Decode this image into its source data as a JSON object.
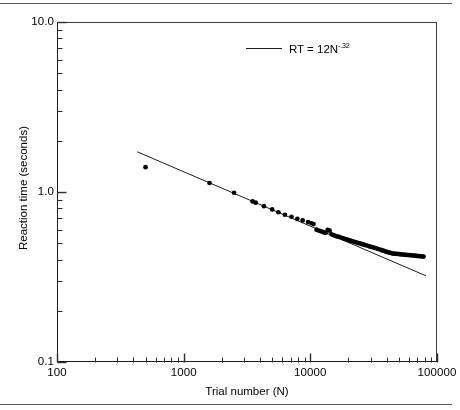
{
  "figure": {
    "name": "power-law-of-practice-plot",
    "background": "#ffffff",
    "ink_color": "#1a1a1a"
  },
  "axes": {
    "x": {
      "title": "Trial number (N)",
      "scale": "log",
      "min": 100,
      "max": 100000,
      "tick_labels": [
        "100",
        "1000",
        "10000",
        "100000"
      ],
      "tick_values": [
        100,
        1000,
        10000,
        100000
      ],
      "minor_ticks": true
    },
    "y": {
      "title": "Reaction time (seconds)",
      "scale": "log",
      "min": 0.1,
      "max": 10.0,
      "tick_labels": [
        "10.0",
        "1.0",
        "0.1"
      ],
      "tick_values": [
        10.0,
        1.0,
        0.1
      ],
      "minor_ticks": true
    }
  },
  "legend": {
    "position": "top-right",
    "swatch": "line-swatch",
    "label_prefix": "RT = 12N",
    "label_exponent": "-.32",
    "label_full": "RT = 12N-.32"
  },
  "chart_data": {
    "type": "scatter",
    "title": "",
    "subtitle": "",
    "xlabel": "Trial number (N)",
    "ylabel": "Reaction time (seconds)",
    "xscale": "log",
    "yscale": "log",
    "xlim": [
      100,
      100000
    ],
    "ylim": [
      0.1,
      10.0
    ],
    "grid": false,
    "legend_position": "top-right",
    "annotations": [],
    "series": [
      {
        "name": "Observed reaction time",
        "type": "scatter",
        "marker": "filled-circle",
        "marker_size_px": 3.6,
        "color": "#000000",
        "points": [
          [
            500,
            1.4
          ],
          [
            1600,
            1.13
          ],
          [
            2500,
            0.99
          ],
          [
            3500,
            0.88
          ],
          [
            3700,
            0.865
          ],
          [
            4300,
            0.825
          ],
          [
            5000,
            0.79
          ],
          [
            5600,
            0.76
          ],
          [
            6300,
            0.735
          ],
          [
            7100,
            0.715
          ],
          [
            7900,
            0.695
          ],
          [
            8700,
            0.68
          ],
          [
            9600,
            0.665
          ],
          [
            10200,
            0.655
          ],
          [
            10600,
            0.648
          ],
          [
            11200,
            0.6
          ],
          [
            11700,
            0.592
          ],
          [
            12200,
            0.586
          ],
          [
            12700,
            0.58
          ],
          [
            13200,
            0.574
          ],
          [
            13700,
            0.598
          ],
          [
            14200,
            0.592
          ],
          [
            14700,
            0.564
          ],
          [
            15200,
            0.558
          ],
          [
            15700,
            0.553
          ],
          [
            16200,
            0.548
          ],
          [
            16800,
            0.545
          ],
          [
            17400,
            0.54
          ],
          [
            18000,
            0.536
          ],
          [
            18600,
            0.531
          ],
          [
            19200,
            0.527
          ],
          [
            19800,
            0.523
          ],
          [
            20500,
            0.519
          ],
          [
            21200,
            0.515
          ],
          [
            21900,
            0.511
          ],
          [
            22600,
            0.508
          ],
          [
            23300,
            0.504
          ],
          [
            24100,
            0.5
          ],
          [
            24900,
            0.497
          ],
          [
            25700,
            0.493
          ],
          [
            26500,
            0.49
          ],
          [
            27400,
            0.486
          ],
          [
            28300,
            0.483
          ],
          [
            29200,
            0.479
          ],
          [
            30100,
            0.476
          ],
          [
            31100,
            0.473
          ],
          [
            32100,
            0.469
          ],
          [
            33200,
            0.466
          ],
          [
            34300,
            0.462
          ],
          [
            35400,
            0.459
          ],
          [
            36500,
            0.455
          ],
          [
            37700,
            0.452
          ],
          [
            38900,
            0.448
          ],
          [
            40200,
            0.444
          ],
          [
            41500,
            0.441
          ],
          [
            42800,
            0.438
          ],
          [
            44200,
            0.436
          ],
          [
            45600,
            0.434
          ],
          [
            47100,
            0.433
          ],
          [
            48600,
            0.432
          ],
          [
            50200,
            0.431
          ],
          [
            51800,
            0.43
          ],
          [
            53500,
            0.429
          ],
          [
            55200,
            0.428
          ],
          [
            57000,
            0.427
          ],
          [
            58800,
            0.426
          ],
          [
            60700,
            0.425
          ],
          [
            62700,
            0.424
          ],
          [
            64700,
            0.423
          ],
          [
            66800,
            0.422
          ],
          [
            69000,
            0.421
          ],
          [
            71200,
            0.42
          ],
          [
            73500,
            0.419
          ],
          [
            75900,
            0.418
          ],
          [
            78300,
            0.417
          ]
        ]
      },
      {
        "name": "RT = 12N-.32",
        "type": "line",
        "color": "#1a1a1a",
        "width_px": 1.0,
        "fit": {
          "coefficient": 12,
          "exponent": -0.32
        },
        "x_range": [
          430,
          82000
        ]
      }
    ]
  }
}
